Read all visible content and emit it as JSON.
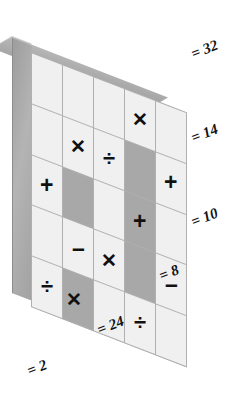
{
  "figure": {
    "type": "math-puzzle-grid",
    "rows": 5,
    "columns": 5,
    "colors": {
      "cell_light": "#f0f0f0",
      "cell_dark": "#a8a8a8",
      "grid_line": "#b0b0b0",
      "slab_side": "#a2a2a2",
      "slab_top": "#a6a6a6",
      "glyph": "#111111",
      "background": "#ffffff"
    }
  },
  "glyphs": {
    "multiply": "✕",
    "divide": "÷",
    "plus": "+",
    "minus": "–",
    "blank": ""
  },
  "grid": {
    "cells": [
      [
        {
          "symbol": "",
          "name": "blank",
          "shade": "light"
        },
        {
          "symbol": "",
          "name": "blank",
          "shade": "light"
        },
        {
          "symbol": "",
          "name": "blank",
          "shade": "light"
        },
        {
          "symbol": "✕",
          "name": "multiply",
          "shade": "light"
        },
        {
          "symbol": "",
          "name": "blank",
          "shade": "light"
        }
      ],
      [
        {
          "symbol": "",
          "name": "blank",
          "shade": "light"
        },
        {
          "symbol": "✕",
          "name": "multiply",
          "shade": "light"
        },
        {
          "symbol": "",
          "name": "blank",
          "shade": "light"
        },
        {
          "symbol": "",
          "name": "blank",
          "shade": "dark"
        },
        {
          "symbol": "+",
          "name": "plus",
          "shade": "light"
        }
      ],
      [
        {
          "symbol": "",
          "name": "blank",
          "shade": "light"
        },
        {
          "symbol": "",
          "name": "blank",
          "shade": "dark"
        },
        {
          "symbol": "÷",
          "name": "divide",
          "shade": "light"
        },
        {
          "symbol": "",
          "name": "blank",
          "shade": "dark"
        },
        {
          "symbol": "",
          "name": "blank",
          "shade": "light"
        }
      ],
      [
        {
          "symbol": "+",
          "name": "plus",
          "shade": "light"
        },
        {
          "symbol": "",
          "name": "blank",
          "shade": "dark"
        },
        {
          "symbol": "",
          "name": "blank",
          "shade": "light"
        },
        {
          "symbol": "+",
          "name": "plus",
          "shade": "light"
        },
        {
          "symbol": "",
          "name": "blank",
          "shade": "light"
        }
      ],
      [
        {
          "symbol": "",
          "name": "blank",
          "shade": "light"
        },
        {
          "symbol": "–",
          "name": "minus",
          "shade": "light"
        },
        {
          "symbol": "",
          "name": "blank",
          "shade": "light"
        },
        {
          "symbol": "",
          "name": "blank",
          "shade": "dark"
        },
        {
          "symbol": "–",
          "name": "minus",
          "shade": "light"
        }
      ],
      [
        {
          "symbol": "",
          "name": "blank",
          "shade": "light"
        },
        {
          "symbol": "",
          "name": "blank",
          "shade": "dark"
        },
        {
          "symbol": "✕",
          "name": "multiply",
          "shade": "light"
        },
        {
          "symbol": "",
          "name": "blank",
          "shade": "dark"
        },
        {
          "symbol": "",
          "name": "blank",
          "shade": "light"
        }
      ],
      [
        {
          "symbol": "÷",
          "name": "divide",
          "shade": "light"
        },
        {
          "symbol": "",
          "name": "blank",
          "shade": "dark"
        },
        {
          "symbol": "",
          "name": "blank",
          "shade": "light"
        },
        {
          "symbol": "÷",
          "name": "divide",
          "shade": "light"
        },
        {
          "symbol": "",
          "name": "blank",
          "shade": "light"
        }
      ],
      [
        {
          "symbol": "",
          "name": "blank",
          "shade": "light"
        },
        {
          "symbol": "✕",
          "name": "multiply",
          "shade": "light"
        },
        {
          "symbol": "",
          "name": "blank",
          "shade": "light"
        },
        {
          "symbol": "",
          "name": "blank",
          "shade": "light"
        },
        {
          "symbol": "",
          "name": "blank",
          "shade": "light"
        }
      ]
    ]
  },
  "labels": {
    "right": [
      {
        "id": "row-1",
        "text": "= 32",
        "value": 32
      },
      {
        "id": "row-2",
        "text": "= 14",
        "value": 14
      },
      {
        "id": "row-3",
        "text": "= 10",
        "value": 10
      },
      {
        "id": "row-4",
        "text": "= 8",
        "value": 8
      }
    ],
    "bottom": [
      {
        "id": "col-b",
        "text": "= 24",
        "value": 24
      },
      {
        "id": "col-a",
        "text": "= 2",
        "value": 2
      }
    ]
  }
}
